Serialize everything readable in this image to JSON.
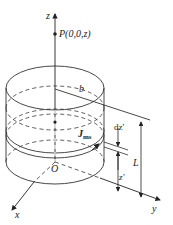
{
  "figure": {
    "type": "cylinder-magnetization-diagram",
    "labels": {
      "z_axis": "z",
      "x_axis": "x",
      "y_axis": "y",
      "origin": "O",
      "point": "P(0,0,z)",
      "radius": "b",
      "current_density_main": "J",
      "current_density_sub": "ms",
      "slice_thickness": "dz′",
      "slice_height": "z′",
      "length": "L"
    },
    "colors": {
      "stroke": "#333333",
      "background": "#ffffff"
    }
  }
}
